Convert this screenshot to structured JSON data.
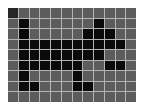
{
  "board": {
    "cols": 12,
    "rows": 9,
    "colors": {
      "empty": "#5c5c5c",
      "filled": "#0a0a0a",
      "cursor": "#262626",
      "grid_line": "#b4b4b4",
      "background": "#ffffff"
    },
    "cursor": {
      "row": 0,
      "col": 0
    },
    "cells": [
      [
        0,
        0,
        0,
        0,
        0,
        0,
        0,
        0,
        0,
        0,
        0,
        0
      ],
      [
        0,
        1,
        0,
        0,
        0,
        0,
        0,
        0,
        1,
        0,
        0,
        0
      ],
      [
        0,
        1,
        0,
        0,
        0,
        0,
        0,
        1,
        1,
        1,
        0,
        0
      ],
      [
        0,
        1,
        1,
        1,
        1,
        1,
        1,
        1,
        1,
        1,
        1,
        0
      ],
      [
        0,
        1,
        1,
        1,
        1,
        1,
        1,
        1,
        1,
        0,
        0,
        0
      ],
      [
        0,
        1,
        1,
        1,
        1,
        1,
        1,
        0,
        0,
        1,
        1,
        0
      ],
      [
        0,
        1,
        0,
        0,
        0,
        0,
        1,
        0,
        0,
        0,
        0,
        0
      ],
      [
        0,
        1,
        1,
        0,
        0,
        0,
        1,
        1,
        0,
        0,
        0,
        0
      ],
      [
        0,
        0,
        0,
        0,
        0,
        0,
        0,
        0,
        0,
        0,
        0,
        0
      ]
    ]
  }
}
